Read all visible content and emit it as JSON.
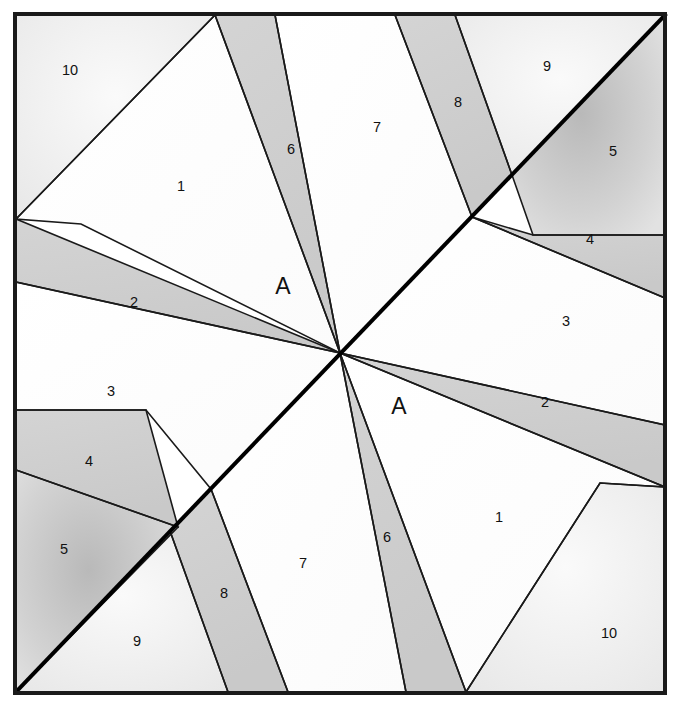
{
  "figure": {
    "canvas": {
      "width": 681,
      "height": 705
    },
    "frame": {
      "x": 15,
      "y": 14,
      "width": 650,
      "height": 679,
      "stroke": "#1a1a1a",
      "stroke_width": 4
    },
    "center_of_symmetry": {
      "x": 340.5,
      "y": 353.5
    },
    "colors": {
      "background": "#ffffff",
      "plain_region": "#fdfdfd",
      "light_region": "#f2f2f2",
      "shaded_band": "#cfcfcf",
      "shaded_region": "#d2d2d2",
      "line": "#1a1a1a",
      "bold_line": "#000000",
      "text": "#111111"
    },
    "main_diagonal": {
      "name": "bold-diagonal",
      "from": {
        "x": 665,
        "y": 15
      },
      "to": {
        "x": 16,
        "y": 692
      },
      "stroke_width": 4
    },
    "labels": {
      "numbers": [
        {
          "id": "label-10-top-left",
          "text": "10",
          "x": 70,
          "y": 71
        },
        {
          "id": "label-1-top-left",
          "text": "1",
          "x": 181,
          "y": 187
        },
        {
          "id": "label-6-top",
          "text": "6",
          "x": 291,
          "y": 150
        },
        {
          "id": "label-7-top",
          "text": "7",
          "x": 377,
          "y": 128
        },
        {
          "id": "label-8-top",
          "text": "8",
          "x": 458,
          "y": 103
        },
        {
          "id": "label-9-top-right",
          "text": "9",
          "x": 547,
          "y": 67
        },
        {
          "id": "label-5-top-right",
          "text": "5",
          "x": 613,
          "y": 152
        },
        {
          "id": "label-4-top-right",
          "text": "4",
          "x": 590,
          "y": 240
        },
        {
          "id": "label-2-left",
          "text": "2",
          "x": 134,
          "y": 303
        },
        {
          "id": "label-3-right",
          "text": "3",
          "x": 566,
          "y": 322
        },
        {
          "id": "label-3-left",
          "text": "3",
          "x": 111,
          "y": 392
        },
        {
          "id": "label-2-right",
          "text": "2",
          "x": 545,
          "y": 403
        },
        {
          "id": "label-4-left",
          "text": "4",
          "x": 89,
          "y": 462
        },
        {
          "id": "label-1-bottom-right",
          "text": "1",
          "x": 499,
          "y": 518
        },
        {
          "id": "label-5-bottom-left",
          "text": "5",
          "x": 64,
          "y": 550
        },
        {
          "id": "label-7-bottom",
          "text": "7",
          "x": 303,
          "y": 564
        },
        {
          "id": "label-6-bottom",
          "text": "6",
          "x": 387,
          "y": 538
        },
        {
          "id": "label-8-bottom",
          "text": "8",
          "x": 224,
          "y": 594
        },
        {
          "id": "label-9-bottom-left",
          "text": "9",
          "x": 137,
          "y": 642
        },
        {
          "id": "label-10-bottom-right",
          "text": "10",
          "x": 609,
          "y": 634
        }
      ],
      "letters": [
        {
          "id": "label-A-upper",
          "text": "A",
          "x": 283,
          "y": 288
        },
        {
          "id": "label-A-lower",
          "text": "A",
          "x": 399,
          "y": 408
        }
      ]
    },
    "regions": [
      {
        "id": "r10-tl",
        "label": "10",
        "fill": "light",
        "points": "16,15 215,15 16,219"
      },
      {
        "id": "r1-tl",
        "label": "1",
        "fill": "plain",
        "points": "215,15 16,219 81,224 340,353"
      },
      {
        "id": "r6-top",
        "label": "6",
        "fill": "band",
        "points": "215,15 275,15 340,353"
      },
      {
        "id": "r7-top",
        "label": "7",
        "fill": "plain",
        "points": "275,15 395,15 472,217 340,353"
      },
      {
        "id": "r8-top",
        "label": "8",
        "fill": "band",
        "points": "395,15 455,15 512,175 472,217"
      },
      {
        "id": "r9-tr",
        "label": "9",
        "fill": "light",
        "points": "455,15 665,15 512,175"
      },
      {
        "id": "r5-tr",
        "label": "5",
        "fill": "shade",
        "points": "665,15 665,235 533,235 512,175"
      },
      {
        "id": "r4-tr",
        "label": "4",
        "fill": "band",
        "points": "533,235 665,235 665,298 472,217"
      },
      {
        "id": "r3-r",
        "label": "3",
        "fill": "plain",
        "points": "472,217 665,298 665,425 340,353"
      },
      {
        "id": "r2-l",
        "label": "2",
        "fill": "band",
        "points": "16,219 16,282 340,353"
      },
      {
        "id": "r3-l",
        "label": "3",
        "fill": "plain",
        "points": "16,282 340,353 211,489 146,410 16,410"
      },
      {
        "id": "r4-l",
        "label": "4",
        "fill": "band",
        "points": "16,410 146,410 178,527 16,470"
      },
      {
        "id": "r5-bl",
        "label": "5",
        "fill": "shade",
        "points": "16,470 178,527 16,692"
      },
      {
        "id": "r2-r",
        "label": "2",
        "fill": "band",
        "points": "665,425 665,487 340,353"
      },
      {
        "id": "r1-br",
        "label": "1",
        "fill": "plain",
        "points": "340,353 665,487 600,483 466,692"
      },
      {
        "id": "r10-br",
        "label": "10",
        "fill": "light",
        "points": "600,483 665,487 665,692 466,692"
      },
      {
        "id": "r6-bot",
        "label": "6",
        "fill": "band",
        "points": "340,353 466,692 406,692"
      },
      {
        "id": "r7-bot",
        "label": "7",
        "fill": "plain",
        "points": "340,353 406,692 288,692 211,489"
      },
      {
        "id": "r8-bot",
        "label": "8",
        "fill": "band",
        "points": "211,489 288,692 228,692 170,531"
      },
      {
        "id": "r9-bl",
        "label": "9",
        "fill": "light",
        "points": "170,531 228,692 16,692"
      }
    ]
  }
}
